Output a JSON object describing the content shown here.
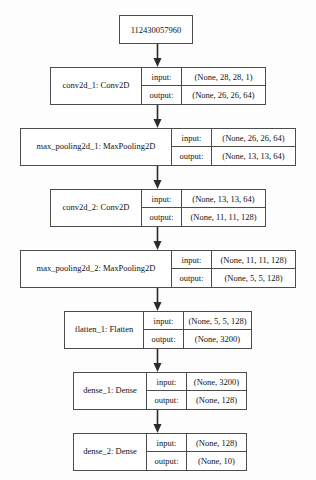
{
  "diagram": {
    "type": "keras-model-plot",
    "orientation": "top-to-bottom",
    "colors": {
      "border": "#4c4c4c",
      "background": "#fdfdfd",
      "text": "#111111",
      "arrow": "#2b2b2b"
    },
    "io_labels": {
      "input": "input:",
      "output": "output:"
    },
    "input_node": {
      "label": "112430057960"
    },
    "nodes": [
      {
        "name": "conv2d_1: Conv2D",
        "input": "(None, 28, 28, 1)",
        "output": "(None, 26, 26, 64)"
      },
      {
        "name": "max_pooling2d_1: MaxPooling2D",
        "input": "(None, 26, 26, 64)",
        "output": "(None, 13, 13, 64)"
      },
      {
        "name": "conv2d_2: Conv2D",
        "input": "(None, 13, 13, 64)",
        "output": "(None, 11, 11, 128)"
      },
      {
        "name": "max_pooling2d_2: MaxPooling2D",
        "input": "(None, 11, 11, 128)",
        "output": "(None, 5, 5, 128)"
      },
      {
        "name": "flatten_1: Flatten",
        "input": "(None, 5, 5, 128)",
        "output": "(None, 3200)"
      },
      {
        "name": "dense_1: Dense",
        "input": "(None, 3200)",
        "output": "(None, 128)"
      },
      {
        "name": "dense_2: Dense",
        "input": "(None, 128)",
        "output": "(None, 10)"
      }
    ]
  }
}
